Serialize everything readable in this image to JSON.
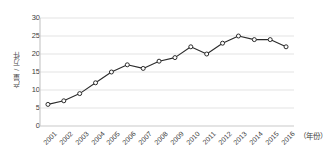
{
  "chart_data": {
    "type": "line",
    "title": "",
    "subtitle": "",
    "xlabel": "（年份）",
    "ylabel": "产量 / 万件",
    "categories": [
      "2001",
      "2002",
      "2003",
      "2004",
      "2005",
      "2006",
      "2007",
      "2008",
      "2009",
      "2010",
      "2011",
      "2012",
      "2013",
      "2014",
      "2015",
      "2016"
    ],
    "values": [
      6,
      7,
      9,
      12,
      15,
      17,
      16,
      18,
      19,
      22,
      20,
      23,
      25,
      24,
      24,
      22
    ],
    "series": [
      {
        "name": "产量",
        "values": [
          6,
          7,
          9,
          12,
          15,
          17,
          16,
          18,
          19,
          22,
          20,
          23,
          25,
          24,
          24,
          22
        ]
      }
    ],
    "ylim": [
      0,
      30
    ],
    "y_ticks": [
      0,
      5,
      10,
      15,
      20,
      25,
      30
    ],
    "x_tick_rotation": -45,
    "grid": "horizontal",
    "legend": "none",
    "annotations": [],
    "colors": {
      "line": "#2b2b2b",
      "marker_fill": "#ffffff",
      "marker_edge": "#2b2b2b",
      "grid": "#e3e3e3",
      "axis": "#c9c9c9",
      "text": "#3d3d3d",
      "background": "#ffffff"
    }
  }
}
